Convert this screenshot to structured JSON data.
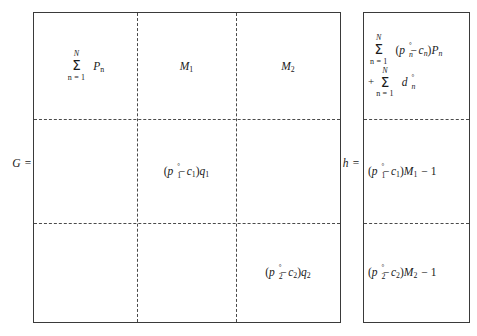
{
  "equation": {
    "matrix_label": "G =",
    "vector_label": "h =",
    "matrix": {
      "name": "G",
      "rows": 3,
      "cols": 3,
      "cells": [
        {
          "row": 0,
          "col": 0,
          "type": "summation",
          "text": "Σ n=1 to N  P_n",
          "upper_limit": "N",
          "lower_limit": "n = 1",
          "operator": "Σ",
          "body_symbol": "P",
          "body_subscript": "n"
        },
        {
          "row": 0,
          "col": 1,
          "type": "symbol",
          "text": "M₁",
          "symbol": "M",
          "subscript": "1"
        },
        {
          "row": 0,
          "col": 2,
          "type": "symbol",
          "text": "M₂",
          "symbol": "M",
          "subscript": "2"
        },
        {
          "row": 1,
          "col": 0,
          "type": "empty",
          "text": ""
        },
        {
          "row": 1,
          "col": 1,
          "type": "expression",
          "text": "(p₁° − c₁)q₁",
          "base": "p",
          "base_sub": "1",
          "base_sup": "°",
          "minus_term": "c",
          "minus_sub": "1",
          "factor": "q",
          "factor_sub": "1"
        },
        {
          "row": 1,
          "col": 2,
          "type": "empty",
          "text": ""
        },
        {
          "row": 2,
          "col": 0,
          "type": "empty",
          "text": ""
        },
        {
          "row": 2,
          "col": 1,
          "type": "empty",
          "text": ""
        },
        {
          "row": 2,
          "col": 2,
          "type": "expression",
          "text": "(p₂° − c₂)q₂",
          "base": "p",
          "base_sub": "2",
          "base_sup": "°",
          "minus_term": "c",
          "minus_sub": "2",
          "factor": "q",
          "factor_sub": "2"
        }
      ]
    },
    "vector": {
      "name": "h",
      "rows": 3,
      "cells": [
        {
          "row": 0,
          "type": "summation-pair",
          "text": "Σ n=1 to N (p_n° − c_n)P_n + Σ n=1 to N d_n°",
          "terms": [
            {
              "operator": "Σ",
              "upper_limit": "N",
              "lower_limit": "n = 1",
              "lead_sign": "",
              "body": "(p_n° − c_n)P_n"
            },
            {
              "operator": "Σ",
              "upper_limit": "N",
              "lower_limit": "n = 1",
              "lead_sign": "+",
              "body": "d_n°"
            }
          ]
        },
        {
          "row": 1,
          "type": "expression",
          "text": "(p₁° − c₁)M₁ − 1",
          "base": "p",
          "base_sub": "1",
          "base_sup": "°",
          "minus_term": "c",
          "minus_sub": "1",
          "factor": "M",
          "factor_sub": "1",
          "tail": "− 1"
        },
        {
          "row": 2,
          "type": "expression",
          "text": "(p₂° − c₂)M₂ − 1",
          "base": "p",
          "base_sub": "2",
          "base_sup": "°",
          "minus_term": "c",
          "minus_sub": "2",
          "factor": "M",
          "factor_sub": "2",
          "tail": "− 1"
        }
      ]
    },
    "symbols": {
      "sigma": "Σ",
      "minus": "−",
      "plus": "+",
      "degree": "°",
      "upper_limit_N": "N",
      "lower_limit_n1": "n = 1",
      "one": "1"
    },
    "colors": {
      "text": "#1a1a1a",
      "border": "#3a3a3a",
      "dashed": "#4a4a4a",
      "background": "#ffffff"
    }
  }
}
